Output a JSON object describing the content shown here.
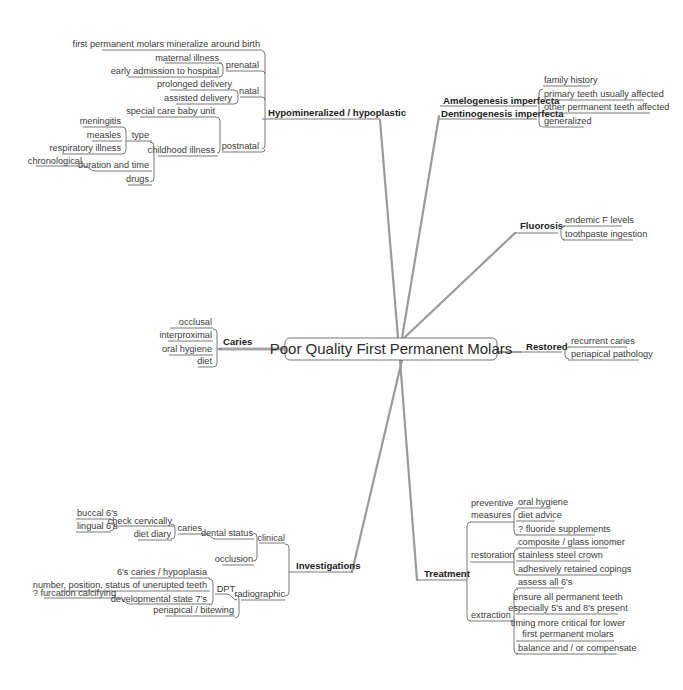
{
  "center": {
    "label": "Poor Quality First Permanent Molars"
  },
  "hypo": {
    "label": "Hypomineralized / hypoplastic",
    "first_molars": "first permanent molars mineralize around birth",
    "prenatal": {
      "label": "prenatal",
      "items": [
        "maternal illness",
        "early admission to hospital"
      ]
    },
    "natal": {
      "label": "natal",
      "items": [
        "prolonged delivery",
        "assisted delivery"
      ]
    },
    "postnatal": {
      "label": "postnatal",
      "special_care": "special care baby unit",
      "childhood_illness": {
        "label": "childhood illness",
        "type": {
          "label": "type",
          "items": [
            "meningitis",
            "measles",
            "respiratory illness"
          ]
        },
        "duration": {
          "label": "duration and time",
          "items": [
            "chronological"
          ]
        },
        "drugs": "drugs"
      }
    }
  },
  "amelo": {
    "labels": [
      "Amelogenesis imperfecta",
      "Dentinogenesis imperfecta"
    ],
    "items": [
      "family history",
      "primary teeth usually affected",
      "other permanent teeth affected",
      "generalized"
    ]
  },
  "fluorosis": {
    "label": "Fluorosis",
    "items": [
      "endemic F levels",
      "toothpaste ingestion"
    ]
  },
  "caries": {
    "label": "Caries",
    "items": [
      "occlusal",
      "interproximal",
      "oral hygiene",
      "diet"
    ]
  },
  "restored": {
    "label": "Restored",
    "items": [
      "recurrent caries",
      "periapical pathology"
    ]
  },
  "investigations": {
    "label": "Investigations",
    "clinical": {
      "label": "clinical",
      "dental_status": {
        "label": "dental status",
        "caries": {
          "label": "caries",
          "check_cervically": {
            "label": "check cervically",
            "items": [
              "buccal 6's",
              "lingual 6's"
            ]
          },
          "diet_diary": "diet diary"
        }
      },
      "occlusion": "occlusion"
    },
    "radiographic": {
      "label": "radiographic",
      "dpt": {
        "label": "DPT",
        "items": [
          "6's caries / hypoplasia",
          "number, position, status of unerupted teeth"
        ],
        "developmental": {
          "label": "developmental state 7's",
          "items": [
            "? furcation calcifying"
          ]
        }
      },
      "periapical": "periapical / bitewing"
    }
  },
  "treatment": {
    "label": "Treatment",
    "preventive": {
      "label_line1": "preventive",
      "label_line2": "measures",
      "items": [
        "oral hygiene",
        "diet advice",
        "? fluoride supplements"
      ]
    },
    "restoration": {
      "label": "restoration",
      "items": [
        "composite / glass ionomer",
        "stainless steel crown",
        "adhesively retained copings"
      ]
    },
    "extraction": {
      "label": "extraction",
      "items": [
        {
          "l1": "assess all 6's"
        },
        {
          "l1": "ensure all permanent teeth",
          "l2": "especially 5's and 8's present"
        },
        {
          "l1": "timing more critical for lower",
          "l2": "first permanent molars"
        },
        {
          "l1": "balance and / or compensate"
        }
      ]
    }
  }
}
